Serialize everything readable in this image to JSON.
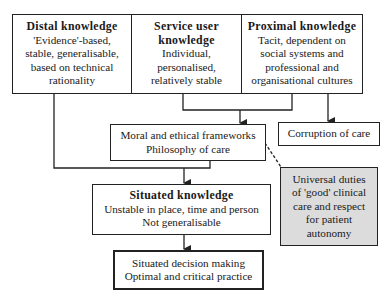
{
  "diagram": {
    "nodes": [
      {
        "id": "distal",
        "title": "Distal knowledge",
        "lines": [
          "'Evidence'-based,",
          "stable, generalisable,",
          "based on technical",
          "rationality"
        ]
      },
      {
        "id": "service",
        "title": "Service user knowledge",
        "title_lines": [
          "Service user",
          "knowledge"
        ],
        "lines": [
          "Individual,",
          "personalised,",
          "relatively stable"
        ]
      },
      {
        "id": "proximal",
        "title": "Proximal knowledge",
        "lines": [
          "Tacit, dependent on",
          "social systems and",
          "professional and",
          "organisational cultures"
        ]
      },
      {
        "id": "moral",
        "title": "",
        "lines": [
          "Moral and ethical frameworks",
          "Philosophy of care"
        ]
      },
      {
        "id": "corruption",
        "title": "",
        "lines": [
          "Corruption of care"
        ]
      },
      {
        "id": "universal",
        "title": "",
        "lines": [
          "Universal duties",
          "of 'good' clinical",
          "care and respect",
          "for patient",
          "autonomy"
        ],
        "fill": "#dcdcdc"
      },
      {
        "id": "situated",
        "title": "Situated knowledge",
        "lines": [
          "Unstable in place, time and person",
          "Not generalisable"
        ]
      },
      {
        "id": "decision",
        "title": "",
        "lines": [
          "Situated decision making",
          "Optimal and critical practice"
        ]
      }
    ],
    "edges": [
      {
        "from": "distal",
        "to": "situated",
        "style": "solid"
      },
      {
        "from": "service",
        "to": "moral",
        "style": "solid-arrow"
      },
      {
        "from": "proximal",
        "to": "moral",
        "style": "solid-arrow"
      },
      {
        "from": "proximal",
        "to": "corruption",
        "style": "solid-arrow"
      },
      {
        "from": "moral",
        "to": "situated",
        "style": "solid-arrow"
      },
      {
        "from": "moral",
        "to": "universal",
        "style": "dashed"
      },
      {
        "from": "situated",
        "to": "decision",
        "style": "solid-arrow"
      }
    ],
    "colors": {
      "line": "#222222",
      "gray_fill": "#dcdcdc",
      "background": "#ffffff"
    }
  }
}
